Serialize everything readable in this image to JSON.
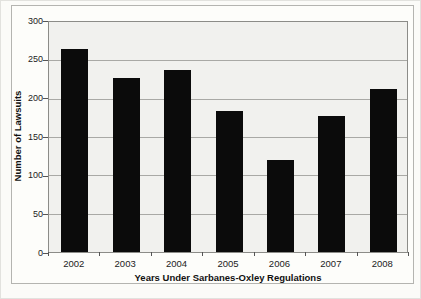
{
  "chart_data": {
    "type": "bar",
    "categories": [
      "2002",
      "2003",
      "2004",
      "2005",
      "2006",
      "2007",
      "2008"
    ],
    "values": [
      265,
      227,
      238,
      184,
      120,
      177,
      212
    ],
    "title": "",
    "xlabel": "Years Under Sarbanes-Oxley Regulations",
    "ylabel": "Number of Lawsuits",
    "ylim": [
      0,
      300
    ],
    "yticks": [
      0,
      50,
      100,
      150,
      200,
      250,
      300
    ],
    "grid": true,
    "legend_position": "none",
    "bar_color": "#0b0b0b",
    "plot_bg_color": "#f1f1ee",
    "gridline_color": "#a9a9a5",
    "frame_bg_color": "#fdfdfa",
    "page_bg_color": "#fbfbf8"
  }
}
